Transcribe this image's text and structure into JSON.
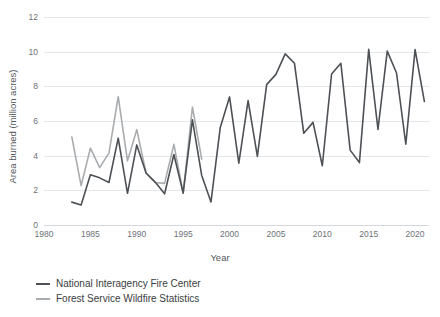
{
  "chart_data": {
    "type": "line",
    "title": "",
    "xlabel": "Year",
    "ylabel": "Area burned (million acres)",
    "xlim": [
      1980,
      2021.5
    ],
    "ylim": [
      0,
      12
    ],
    "xticks": [
      1980,
      1985,
      1990,
      1995,
      2000,
      2005,
      2010,
      2015,
      2020
    ],
    "yticks": [
      0,
      2,
      4,
      6,
      8,
      10,
      12
    ],
    "xtick_labels": [
      "1980",
      "1985",
      "1990",
      "1995",
      "2000",
      "2005",
      "2010",
      "2015",
      "2020"
    ],
    "ytick_labels": [
      "0",
      "2",
      "4",
      "6",
      "8",
      "10",
      "12"
    ],
    "grid": "horizontal",
    "legend_position": "below-left",
    "series": [
      {
        "name": "National Interagency Fire Center",
        "color": "#4d5155",
        "x": [
          1983,
          1984,
          1985,
          1986,
          1987,
          1988,
          1989,
          1990,
          1991,
          1992,
          1993,
          1994,
          1995,
          1996,
          1997,
          1998,
          1999,
          2000,
          2001,
          2002,
          2003,
          2004,
          2005,
          2006,
          2007,
          2008,
          2009,
          2010,
          2011,
          2012,
          2013,
          2014,
          2015,
          2016,
          2017,
          2018,
          2019,
          2020,
          2021
        ],
        "values": [
          1.32,
          1.15,
          2.9,
          2.72,
          2.45,
          5.01,
          1.83,
          4.62,
          3.0,
          2.46,
          1.8,
          4.07,
          1.84,
          6.07,
          2.86,
          1.33,
          5.63,
          7.39,
          3.57,
          7.18,
          3.96,
          8.1,
          8.69,
          9.87,
          9.33,
          5.29,
          5.92,
          3.42,
          8.71,
          9.33,
          4.32,
          3.6,
          10.13,
          5.51,
          10.03,
          8.77,
          4.66,
          10.12,
          7.13
        ]
      },
      {
        "name": "Forest Service Wildfire Statistics",
        "color": "#a9acaf",
        "x": [
          1983,
          1984,
          1985,
          1986,
          1987,
          1988,
          1989,
          1990,
          1991,
          1992,
          1993,
          1994,
          1995,
          1996,
          1997
        ],
        "values": [
          5.08,
          2.27,
          4.43,
          3.31,
          4.15,
          7.4,
          3.7,
          5.5,
          3.0,
          2.45,
          2.4,
          4.65,
          1.85,
          6.8,
          3.8
        ]
      }
    ]
  },
  "axes": {
    "x_title": "Year",
    "y_title": "Area burned (million acres)"
  },
  "legend": {
    "items": [
      {
        "label": "National Interagency Fire Center",
        "color": "#4d5155"
      },
      {
        "label": "Forest Service Wildfire Statistics",
        "color": "#a9acaf"
      }
    ]
  }
}
